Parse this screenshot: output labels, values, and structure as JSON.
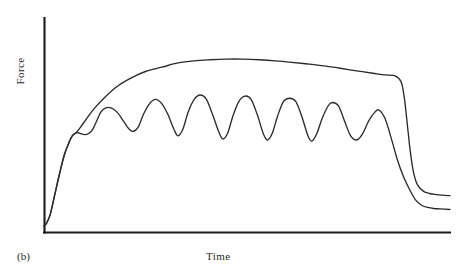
{
  "figure": {
    "panel_label": "(b)",
    "xlabel": "Time",
    "ylabel": "Force",
    "stroke_color": "#2b2b2b",
    "axis_color": "#1a1a1a",
    "background_color": "#ffffff"
  },
  "chart_data": {
    "type": "line",
    "title": "",
    "subtitle": "",
    "xlabel": "Time",
    "ylabel": "Force",
    "panel_label": "(b)",
    "grid": false,
    "legend": null,
    "axes": {
      "x_axis_visible": true,
      "y_axis_visible": true,
      "x_ticks": [],
      "y_ticks": [],
      "x_tick_labels": [],
      "y_tick_labels": [],
      "xlim": [
        0,
        100
      ],
      "ylim": [
        0,
        100
      ],
      "x_axis_pixel_span": [
        44,
        450
      ],
      "y_axis_pixel_span": [
        18,
        232
      ],
      "origin_pixel": [
        44,
        232
      ]
    },
    "annotations": [
      {
        "text": "(b)",
        "position": "below-axis-left"
      }
    ],
    "series": [
      {
        "name": "fused tetanus",
        "description": "smooth upper envelope curve that rises to a sustained plateau then drops sharply",
        "color": "#2b2b2b",
        "x": [
          0,
          0.6,
          1.5,
          2.6,
          3.8,
          5.0,
          6.2,
          7.0,
          7.6,
          8.2,
          9.0,
          10.5,
          12.5,
          15.0,
          18.0,
          21.5,
          25.0,
          29.0,
          33.0,
          37.0,
          41.0,
          45.0,
          49.0,
          53.0,
          57.0,
          61.0,
          65.0,
          69.0,
          73.0,
          77.0,
          81.0,
          84.0,
          86.5,
          88.0,
          88.8,
          89.5,
          90.2,
          91.0,
          92.0,
          93.5,
          95.0,
          96.5,
          98.0,
          100.0
        ],
        "y": [
          3,
          4,
          8,
          17,
          27,
          36,
          42,
          45,
          46,
          47,
          49,
          53,
          58,
          63,
          68,
          72,
          75,
          77,
          79,
          80,
          80.5,
          80.8,
          80.8,
          80.5,
          80,
          79.3,
          78.5,
          77.6,
          76.5,
          75.3,
          74.2,
          73.4,
          73.0,
          70,
          62,
          50,
          38,
          28,
          22,
          19,
          18,
          17.5,
          17.2,
          17.0
        ]
      },
      {
        "name": "unfused tetanus",
        "description": "lower oscillating curve with seven successive twitch peaks superimposed on a rising baseline, then a gradual decline",
        "color": "#2b2b2b",
        "peak_count": 7,
        "peak_x": [
          16.5,
          27.5,
          38.5,
          49.5,
          60.5,
          71.0,
          82.5
        ],
        "peak_y": [
          58,
          62,
          64,
          63.5,
          62.5,
          60.5,
          57
        ],
        "trough_x": [
          22.0,
          33.0,
          44.0,
          55.0,
          66.0,
          77.0
        ],
        "trough_y": [
          47,
          45,
          43.5,
          43,
          42.5,
          43
        ],
        "x": [
          0,
          0.6,
          1.5,
          2.6,
          3.8,
          5.0,
          6.2,
          7.0,
          7.6,
          8.2,
          9.0,
          10.0,
          11.0,
          12.0,
          13.0,
          14.0,
          15.2,
          16.5,
          18.0,
          19.5,
          21.0,
          22.0,
          23.2,
          24.5,
          26.0,
          27.5,
          29.0,
          30.5,
          32.0,
          33.0,
          34.2,
          35.5,
          37.0,
          38.5,
          40.0,
          41.5,
          43.0,
          44.0,
          45.2,
          46.5,
          48.0,
          49.5,
          51.0,
          52.5,
          54.0,
          55.0,
          56.2,
          57.5,
          59.0,
          60.5,
          62.0,
          63.5,
          65.0,
          66.0,
          67.2,
          68.5,
          70.0,
          71.0,
          72.5,
          74.0,
          75.5,
          77.0,
          78.5,
          80.0,
          81.5,
          82.5,
          84.0,
          85.5,
          87.0,
          88.5,
          90.0,
          91.5,
          93.0,
          94.5,
          96.0,
          97.5,
          100.0
        ],
        "y": [
          3,
          4,
          8,
          17,
          27,
          36,
          42,
          45,
          46,
          46.5,
          46,
          45.5,
          46,
          48,
          52,
          56,
          58,
          58,
          56,
          52,
          48,
          47,
          49,
          55,
          60,
          62,
          60,
          55,
          48,
          45,
          48,
          56,
          62,
          64,
          62,
          55,
          47,
          43.5,
          46,
          54,
          61,
          63.5,
          62,
          55,
          46,
          43,
          46,
          54,
          61,
          62.5,
          61,
          54,
          45,
          42.5,
          46,
          53,
          59,
          60.5,
          59,
          52,
          45,
          43,
          46,
          52,
          56,
          57,
          53,
          44,
          34,
          26,
          20,
          15,
          12.5,
          11.5,
          11,
          10.8,
          10.5
        ]
      }
    ]
  }
}
